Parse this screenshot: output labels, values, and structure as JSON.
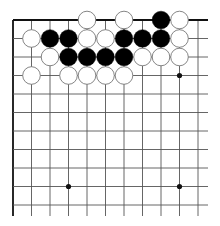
{
  "board": {
    "x0": 13,
    "y0": 20,
    "spacing": 18.5,
    "cols": 11,
    "rows": 11,
    "line_right": 208,
    "line_bottom": 216,
    "line_color": "#555555",
    "edge_color": "#111111",
    "star_points": [
      [
        3,
        9
      ],
      [
        9,
        9
      ],
      [
        9,
        3
      ]
    ],
    "stones": [
      {
        "color": "white",
        "col": 4,
        "row": 0
      },
      {
        "color": "white",
        "col": 6,
        "row": 0
      },
      {
        "color": "black",
        "col": 8,
        "row": 0
      },
      {
        "color": "white",
        "col": 9,
        "row": 0
      },
      {
        "color": "white",
        "col": 1,
        "row": 1
      },
      {
        "color": "black",
        "col": 2,
        "row": 1
      },
      {
        "color": "black",
        "col": 3,
        "row": 1
      },
      {
        "color": "white",
        "col": 4,
        "row": 1
      },
      {
        "color": "white",
        "col": 5,
        "row": 1
      },
      {
        "color": "black",
        "col": 6,
        "row": 1
      },
      {
        "color": "black",
        "col": 7,
        "row": 1
      },
      {
        "color": "black",
        "col": 8,
        "row": 1
      },
      {
        "color": "white",
        "col": 9,
        "row": 1
      },
      {
        "color": "white",
        "col": 2,
        "row": 2
      },
      {
        "color": "black",
        "col": 3,
        "row": 2
      },
      {
        "color": "black",
        "col": 4,
        "row": 2
      },
      {
        "color": "black",
        "col": 5,
        "row": 2
      },
      {
        "color": "black",
        "col": 6,
        "row": 2
      },
      {
        "color": "white",
        "col": 7,
        "row": 2
      },
      {
        "color": "white",
        "col": 8,
        "row": 2
      },
      {
        "color": "white",
        "col": 9,
        "row": 2
      },
      {
        "color": "white",
        "col": 1,
        "row": 3
      },
      {
        "color": "white",
        "col": 3,
        "row": 3
      },
      {
        "color": "white",
        "col": 4,
        "row": 3
      },
      {
        "color": "white",
        "col": 5,
        "row": 3
      },
      {
        "color": "white",
        "col": 6,
        "row": 3
      }
    ]
  }
}
